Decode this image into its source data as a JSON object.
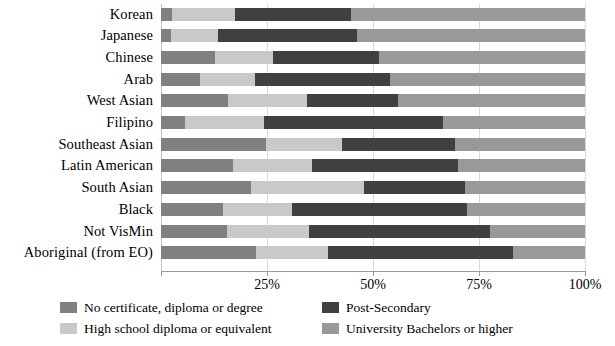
{
  "chart_data": {
    "type": "bar",
    "orientation": "horizontal",
    "stacked": true,
    "stack_total": 100,
    "title": "",
    "subtitle": "",
    "xlabel": "",
    "ylabel": "",
    "xlim": [
      0,
      100
    ],
    "xticks": [
      0,
      25,
      50,
      75,
      100
    ],
    "xtick_labels": [
      "",
      "25%",
      "50%",
      "75%",
      "100%"
    ],
    "grid": true,
    "grid_axis": "x",
    "legend_position": "bottom",
    "categories": [
      "Korean",
      "Japanese",
      "Chinese",
      "Arab",
      "West Asian",
      "Filipino",
      "Southeast Asian",
      "Latin American",
      "South Asian",
      "Black",
      "Not VisMin",
      "Aboriginal (from EO)"
    ],
    "series": [
      {
        "name": "No certificate, diploma or degree",
        "color": "#808080",
        "values": [
          2.6,
          2.4,
          12.8,
          9.3,
          15.9,
          5.6,
          24.7,
          17.0,
          21.2,
          14.7,
          15.6,
          22.5
        ]
      },
      {
        "name": "High school diploma or equivalent",
        "color": "#c9c9c9",
        "values": [
          14.9,
          11.1,
          13.7,
          12.8,
          18.5,
          18.6,
          17.9,
          18.6,
          26.7,
          16.3,
          19.3,
          17.0
        ]
      },
      {
        "name": "Post-Secondary",
        "color": "#404040",
        "values": [
          27.3,
          32.7,
          24.8,
          32.0,
          21.6,
          42.3,
          26.7,
          34.4,
          23.8,
          41.1,
          42.8,
          43.5
        ]
      },
      {
        "name": "University Bachelors or higher",
        "color": "#999999",
        "values": [
          55.2,
          53.8,
          48.7,
          45.9,
          44.0,
          33.5,
          30.7,
          30.0,
          28.3,
          27.9,
          22.3,
          17.0
        ]
      }
    ]
  },
  "legend": {
    "entries": [
      {
        "label": "No certificate, diploma or degree",
        "color": "#808080"
      },
      {
        "label": "High school diploma or equivalent",
        "color": "#c9c9c9"
      },
      {
        "label": "Post-Secondary",
        "color": "#404040"
      },
      {
        "label": "University Bachelors or higher",
        "color": "#999999"
      }
    ]
  },
  "axis": {
    "tick_labels": [
      "25%",
      "50%",
      "75%",
      "100%"
    ]
  }
}
